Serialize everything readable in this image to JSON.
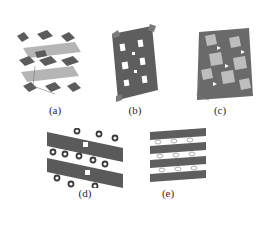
{
  "figure": {
    "panels": [
      {
        "id": "a",
        "label": "(a)",
        "description": "layered polyhedral crystal structure with light gray sheets"
      },
      {
        "id": "b",
        "label": "(b)",
        "description": "dense framework of dark polyhedra with rectangular channels"
      },
      {
        "id": "c",
        "label": "(c)",
        "description": "mixed light and dark polyhedra framework"
      },
      {
        "id": "d",
        "label": "(d)",
        "description": "diagonal dark layers separated by ring-shaped atoms"
      },
      {
        "id": "e",
        "label": "(e)",
        "description": "layered framework with open cages"
      }
    ],
    "colors": {
      "dark_polyhedra": "#5a5a5a",
      "light_polyhedra": "#b8b8b8",
      "background": "#ffffff",
      "label_text": "#2a2a2a"
    }
  }
}
